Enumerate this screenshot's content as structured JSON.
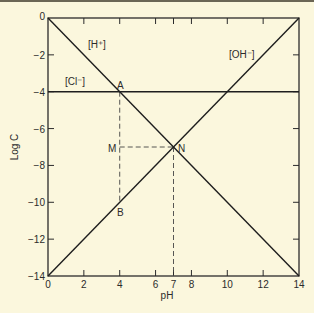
{
  "chart_data": {
    "type": "line",
    "title": "",
    "xlabel": "pH",
    "ylabel": "Log C",
    "xlim": [
      0,
      14
    ],
    "ylim": [
      -14,
      0
    ],
    "grid": false,
    "legend": "none (inline labels)",
    "x_ticks": [
      0,
      2,
      4,
      6,
      7,
      8,
      10,
      12,
      14
    ],
    "x_tick_labels": [
      "0",
      "2",
      "4",
      "6",
      "7",
      "8",
      "10",
      "12",
      "14"
    ],
    "y_ticks": [
      0,
      -2,
      -4,
      -6,
      -8,
      -10,
      -12,
      -14
    ],
    "y_tick_labels": [
      "0",
      "−2",
      "−4",
      "−6",
      "−8",
      "−10",
      "−12",
      "−14"
    ],
    "series": [
      {
        "name": "[H+]",
        "label": "[H⁺]",
        "x": [
          0,
          14
        ],
        "y": [
          0,
          -14
        ],
        "style": "solid"
      },
      {
        "name": "[OH-]",
        "label": "[OH⁻]",
        "x": [
          0,
          14
        ],
        "y": [
          -14,
          0
        ],
        "style": "solid"
      },
      {
        "name": "[Cl-]",
        "label": "[Cl⁻]",
        "x": [
          0,
          14
        ],
        "y": [
          -4,
          -4
        ],
        "style": "solid"
      }
    ],
    "guides": [
      {
        "name": "A-B vertical",
        "x": [
          4,
          4
        ],
        "y": [
          -4,
          -10
        ],
        "style": "dashed"
      },
      {
        "name": "M-N horizontal",
        "x": [
          4,
          7
        ],
        "y": [
          -7,
          -7
        ],
        "style": "dashed"
      },
      {
        "name": "N-axis vertical",
        "x": [
          7,
          7
        ],
        "y": [
          -7,
          -14
        ],
        "style": "dashed"
      }
    ],
    "points": [
      {
        "label": "A",
        "x": 4,
        "y": -4
      },
      {
        "label": "B",
        "x": 4,
        "y": -10
      },
      {
        "label": "M",
        "x": 4,
        "y": -7
      },
      {
        "label": "N",
        "x": 7,
        "y": -7
      }
    ]
  },
  "labels": {
    "h": "[H⁺]",
    "oh": "[OH⁻]",
    "cl": "[Cl⁻]",
    "A": "A",
    "B": "B",
    "M": "M",
    "N": "N",
    "xlabel": "pH",
    "ylabel": "Log C"
  }
}
